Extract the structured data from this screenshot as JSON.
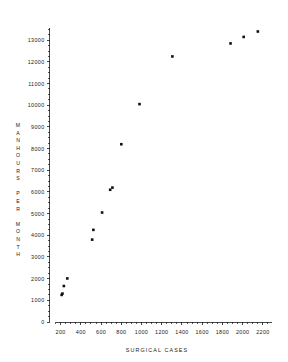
{
  "chart_data": {
    "type": "scatter",
    "title": "",
    "xlabel": "SURGICAL CASES",
    "ylabel": "MANHOURS PER MONTH",
    "xlim": [
      90,
      2290
    ],
    "ylim": [
      0,
      13700
    ],
    "grid": false,
    "legend": "none",
    "x_ticks": [
      200,
      400,
      600,
      800,
      1000,
      1200,
      1400,
      1600,
      1800,
      2000,
      2200
    ],
    "x_tick_labels": [
      "200",
      "400",
      "600",
      "800",
      "1000",
      "1200",
      "1400",
      "1600",
      "1800",
      "2000",
      "2200"
    ],
    "x_minor_step": 50,
    "y_ticks": [
      0,
      1000,
      2000,
      3000,
      4000,
      5000,
      6000,
      7000,
      8000,
      9000,
      10000,
      11000,
      12000,
      13000
    ],
    "y_tick_labels": [
      "0",
      "1000",
      "2000",
      "3000",
      "4000",
      "5000",
      "6000",
      "7000",
      "8000",
      "9000",
      "10000",
      "11000",
      "12000",
      "13000"
    ],
    "y_minor_step": 250,
    "marker": "filled-square",
    "marker_color": "#111111",
    "series": [
      {
        "name": "hospital-observations",
        "points": [
          {
            "x": 210,
            "y": 1250
          },
          {
            "x": 218,
            "y": 1310
          },
          {
            "x": 232,
            "y": 1660
          },
          {
            "x": 266,
            "y": 2010
          },
          {
            "x": 512,
            "y": 3800
          },
          {
            "x": 524,
            "y": 4250
          },
          {
            "x": 610,
            "y": 5050
          },
          {
            "x": 690,
            "y": 6100
          },
          {
            "x": 712,
            "y": 6200
          },
          {
            "x": 800,
            "y": 8200
          },
          {
            "x": 980,
            "y": 10050
          },
          {
            "x": 1305,
            "y": 12250
          },
          {
            "x": 1880,
            "y": 12850
          },
          {
            "x": 2010,
            "y": 13150
          },
          {
            "x": 2150,
            "y": 13400
          }
        ]
      }
    ]
  },
  "axes": {
    "y_label_chars": [
      "M",
      "A",
      "N",
      "H",
      "O",
      "U",
      "R",
      "S",
      "",
      "P",
      "E",
      "R",
      "",
      "M",
      "O",
      "N",
      "T",
      "H"
    ]
  }
}
